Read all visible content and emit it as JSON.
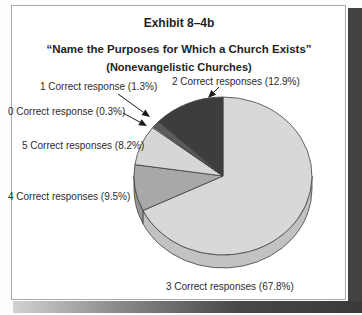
{
  "chart_data": {
    "type": "pie",
    "title": "Exhibit 8–4b",
    "subtitle": "“Name the Purposes for Which a Church Exists”",
    "note": "(Nonevangelistic Churches)",
    "unit": "percent",
    "legend_position": "callout-labels",
    "style": "3d-pie, grayscale, starts at 12 o'clock going clockwise",
    "slices": [
      {
        "label": "3 Correct responses",
        "value": 67.8,
        "display": "3 Correct responses (67.8%)",
        "color": "#d8d8d8"
      },
      {
        "label": "4 Correct responses",
        "value": 9.5,
        "display": "4 Correct responses (9.5%)",
        "color": "#a8a8a8"
      },
      {
        "label": "5 Correct responses",
        "value": 8.2,
        "display": "5 Correct responses (8.2%)",
        "color": "#d6d6d6"
      },
      {
        "label": "0 Correct response",
        "value": 0.3,
        "display": "0 Correct response (0.3%)",
        "color": "#979797"
      },
      {
        "label": "1 Correct response",
        "value": 1.3,
        "display": "1 Correct response (1.3%)",
        "color": "#5c5c5c"
      },
      {
        "label": "2 Correct responses",
        "value": 12.9,
        "display": "2 Correct responses (12.9%)",
        "color": "#3d3d3d"
      }
    ],
    "colors": {
      "outline": "#3f3f3f",
      "arrow": "#1a1a1a",
      "shadow": "#424242",
      "card_border": "#a9a9a9"
    }
  }
}
